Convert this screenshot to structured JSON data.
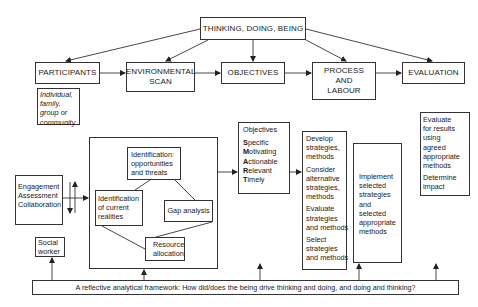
{
  "top": {
    "root": "THINKING, DOING, BEING",
    "stages": [
      {
        "id": "participants",
        "label": "PARTICIPANTS"
      },
      {
        "id": "environmental-scan",
        "label": "ENVIRONMENTAL SCAN"
      },
      {
        "id": "objectives",
        "label": "OBJECTIVES"
      },
      {
        "id": "process-and-labour",
        "label_lines": [
          "PROCESS",
          "AND",
          "LABOUR"
        ]
      },
      {
        "id": "evaluation",
        "label": "EVALUATION"
      }
    ]
  },
  "participants_note": {
    "lines": [
      "Individual,",
      "family,",
      "group or",
      "community"
    ]
  },
  "engagement": {
    "lines": [
      "Engagement",
      "Assessment",
      "Collaboration"
    ]
  },
  "scan_cycle": {
    "opportunities": [
      "Identification:",
      "opportunities",
      "and threats"
    ],
    "current": [
      "Identification",
      "of current",
      "realities"
    ],
    "gap": "Gap analysis",
    "resource": [
      "Resource",
      "allocation"
    ]
  },
  "smart": {
    "title": "Objectives",
    "items": [
      {
        "initial": "S",
        "rest": "pecific"
      },
      {
        "initial": "M",
        "rest": "otivating"
      },
      {
        "initial": "A",
        "rest": "ctionable"
      },
      {
        "initial": "R",
        "rest": "elevant"
      },
      {
        "initial": "T",
        "rest": "imely"
      }
    ]
  },
  "strategies": {
    "groups": [
      [
        "Develop",
        "strategies,",
        "methods"
      ],
      [
        "Consider",
        "alternative",
        "strategies,",
        "methods"
      ],
      [
        "Evaluate",
        "strategies",
        "and methods"
      ],
      [
        "Select",
        "strategies",
        "and methods"
      ]
    ]
  },
  "implement": {
    "lines": [
      "Implement",
      "selected",
      "strategies",
      "and",
      "selected",
      "appropriate",
      "methods"
    ]
  },
  "evaluate": {
    "groups": [
      [
        "Evaluate",
        "for results",
        "using",
        "agreed",
        "appropriate",
        "methods"
      ],
      [
        "Determine",
        "impact"
      ]
    ]
  },
  "social_worker": {
    "lines": [
      "Social",
      "worker"
    ]
  },
  "framework": {
    "text": "A reflective analytical framework: How did/does the being drive thinking and doing, and doing and thinking?"
  }
}
